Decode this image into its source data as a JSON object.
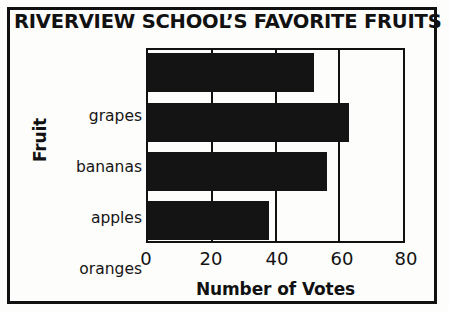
{
  "chart_data": {
    "type": "bar",
    "orientation": "horizontal",
    "title": "RIVERVIEW SCHOOL’S FAVORITE FRUITS",
    "xlabel": "Number of Votes",
    "ylabel": "Fruit",
    "categories": [
      "grapes",
      "bananas",
      "apples",
      "oranges"
    ],
    "values": [
      52,
      63,
      56,
      38
    ],
    "xlim": [
      0,
      80
    ],
    "xticks": [
      0,
      20,
      40,
      60,
      80
    ],
    "xtick_labels": [
      "0",
      "20",
      "40",
      "60",
      "80"
    ],
    "grid": true,
    "grid_axis": "x",
    "legend": false,
    "bar_color": "#141414",
    "frame_color": "#111111",
    "background_color": "#fdfdfb"
  },
  "figure": {
    "title": "RIVERVIEW SCHOOL’S FAVORITE FRUITS",
    "axis_titles": {
      "x": "Number of Votes",
      "y": "Fruit"
    },
    "category_labels": [
      "grapes",
      "bananas",
      "apples",
      "oranges"
    ],
    "tick_labels": [
      "0",
      "20",
      "40",
      "60",
      "80"
    ]
  }
}
